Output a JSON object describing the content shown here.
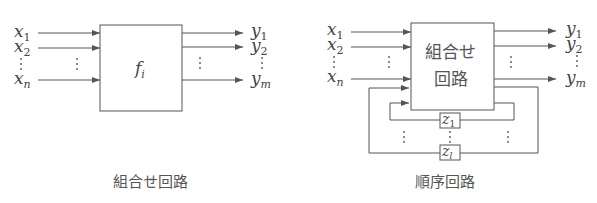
{
  "left_diagram": {
    "caption": "組合せ回路",
    "box_label": "f",
    "box_label_sub": "i",
    "inputs": [
      {
        "var": "x",
        "sub": "1"
      },
      {
        "var": "x",
        "sub": "2"
      },
      {
        "var": "x",
        "sub": "n"
      }
    ],
    "outputs": [
      {
        "var": "y",
        "sub": "1"
      },
      {
        "var": "y",
        "sub": "2"
      },
      {
        "var": "y",
        "sub": "m"
      }
    ]
  },
  "right_diagram": {
    "caption": "順序回路",
    "box_label_line1": "組合せ",
    "box_label_line2": "回路",
    "inputs": [
      {
        "var": "x",
        "sub": "1"
      },
      {
        "var": "x",
        "sub": "2"
      },
      {
        "var": "x",
        "sub": "n"
      }
    ],
    "outputs": [
      {
        "var": "y",
        "sub": "1"
      },
      {
        "var": "y",
        "sub": "2"
      },
      {
        "var": "y",
        "sub": "m"
      }
    ],
    "state_elements": [
      {
        "var": "z",
        "sub": "1"
      },
      {
        "var": "z",
        "sub": "l"
      }
    ]
  },
  "colors": {
    "line": "#555555",
    "text": "#444444",
    "background": "#ffffff"
  }
}
